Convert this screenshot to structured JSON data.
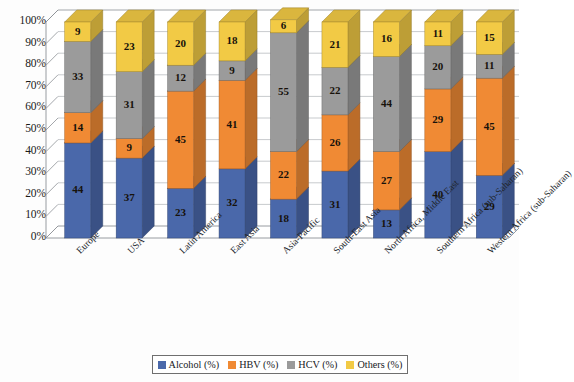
{
  "chart_data": {
    "type": "bar",
    "subtype": "stacked-100-3d",
    "title": "",
    "xlabel": "",
    "ylabel": "",
    "ylim": [
      0,
      100
    ],
    "grid": true,
    "legend_position": "bottom",
    "categories": [
      "Europe",
      "USA",
      "Latin America",
      "East Asia",
      "Asia-Pacific",
      "South-East Asia",
      "North Africa, Middle East",
      "Southern Africa (sub-Saharan)",
      "Western Africa (sub-Saharan)"
    ],
    "series": [
      {
        "name": "Alcohol (%)",
        "color": "#4a68aa",
        "values": [
          44,
          37,
          23,
          32,
          18,
          31,
          13,
          40,
          29
        ]
      },
      {
        "name": "HBV (%)",
        "color": "#f08a34",
        "values": [
          14,
          9,
          45,
          41,
          22,
          26,
          27,
          29,
          45
        ]
      },
      {
        "name": "HCV (%)",
        "color": "#9b9b9b",
        "values": [
          33,
          31,
          12,
          9,
          55,
          22,
          44,
          20,
          11
        ]
      },
      {
        "name": "Others (%)",
        "color": "#f2ca45",
        "values": [
          9,
          23,
          20,
          18,
          6,
          21,
          16,
          11,
          15
        ]
      }
    ],
    "yticks": [
      "0%",
      "10%",
      "20%",
      "30%",
      "40%",
      "50%",
      "60%",
      "70%",
      "80%",
      "90%",
      "100%"
    ],
    "ytick_values": [
      0,
      10,
      20,
      30,
      40,
      50,
      60,
      70,
      80,
      90,
      100
    ]
  },
  "legend": {
    "items": [
      {
        "label": "Alcohol (%)",
        "color": "#4a68aa"
      },
      {
        "label": "HBV (%)",
        "color": "#f08a34"
      },
      {
        "label": "HCV (%)",
        "color": "#9b9b9b"
      },
      {
        "label": "Others (%)",
        "color": "#f2ca45"
      }
    ]
  },
  "colors": {
    "alcohol": "#4a68aa",
    "hbv": "#f08a34",
    "hcv": "#9b9b9b",
    "others": "#f2ca45",
    "gridline": "#b9bcc0",
    "wall": "#ffffff",
    "floor": "#ffffff",
    "axis": "#8d9196"
  }
}
